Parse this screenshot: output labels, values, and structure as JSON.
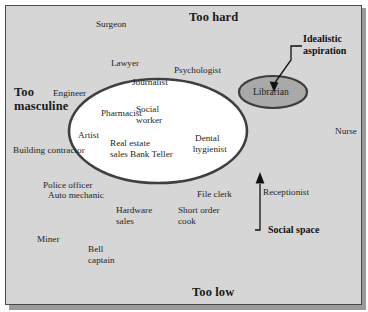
{
  "figure": {
    "type": "conceptual-quadrant-diagram",
    "background_color": "#d6d6d6",
    "border_color": "#4a4a4a"
  },
  "axis_labels": {
    "top": "Too hard",
    "bottom": "Too low",
    "left_line1": "Too",
    "left_line2": "masculine"
  },
  "callouts": [
    {
      "name": "idealistic-aspiration",
      "line1": "Idealistic",
      "line2": "aspiration",
      "target": "Librarian"
    },
    {
      "name": "social-space",
      "line1": "Social space",
      "line2": "",
      "target": "central ellipse"
    }
  ],
  "shapes": {
    "social_space_ellipse": {
      "label": "Social space",
      "fill": "#ffffff",
      "stroke": "#4a4a4a"
    },
    "aspiration_ellipse": {
      "label": "Librarian",
      "fill": "#a8a8a8",
      "stroke": "#3c3c3c"
    }
  },
  "occupations": {
    "inside_aspiration": [
      {
        "name": "librarian",
        "text": "Librarian"
      }
    ],
    "inside_social_space": [
      {
        "name": "social-worker",
        "line1": "Social",
        "line2": "worker"
      },
      {
        "name": "artist",
        "line1": "Artist",
        "line2": ""
      },
      {
        "name": "bank-teller",
        "line1": "Bank Teller",
        "line2": ""
      },
      {
        "name": "dental-hygienist",
        "line1": "Dental",
        "line2": "hygienist"
      }
    ],
    "outside": [
      {
        "name": "surgeon",
        "line1": "Surgeon",
        "line2": ""
      },
      {
        "name": "lawyer",
        "line1": "Lawyer",
        "line2": ""
      },
      {
        "name": "psychologist",
        "line1": "Psychologist",
        "line2": ""
      },
      {
        "name": "journalist",
        "line1": "Journalist",
        "line2": ""
      },
      {
        "name": "engineer",
        "line1": "Engineer",
        "line2": ""
      },
      {
        "name": "pharmacist",
        "line1": "Pharmacist",
        "line2": ""
      },
      {
        "name": "real-estate-sales",
        "line1": "Real estate",
        "line2": "sales"
      },
      {
        "name": "building-contractor",
        "line1": "Building contractor",
        "line2": ""
      },
      {
        "name": "nurse",
        "line1": "Nurse",
        "line2": ""
      },
      {
        "name": "police-officer",
        "line1": "Police officer",
        "line2": ""
      },
      {
        "name": "auto-mechanic",
        "line1": "Auto mechanic",
        "line2": ""
      },
      {
        "name": "hardware-sales",
        "line1": "Hardware",
        "line2": "sales"
      },
      {
        "name": "short-order-cook",
        "line1": "Short order",
        "line2": "cook"
      },
      {
        "name": "file-clerk",
        "line1": "File clerk",
        "line2": ""
      },
      {
        "name": "receptionist",
        "line1": "Receptionist",
        "line2": ""
      },
      {
        "name": "miner",
        "line1": "Miner",
        "line2": ""
      },
      {
        "name": "bell-captain",
        "line1": "Bell",
        "line2": "captain"
      }
    ]
  }
}
